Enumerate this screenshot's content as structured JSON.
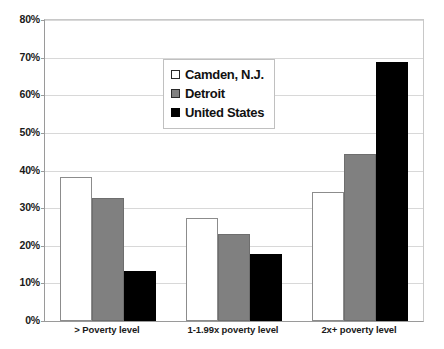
{
  "chart_data": {
    "type": "bar",
    "title": "",
    "subtitle": "",
    "xlabel": "",
    "ylabel": "",
    "categories": [
      "> Poverty level",
      "1-1.99x poverty level",
      "2x+ poverty level"
    ],
    "series": [
      {
        "name": "Camden, N.J.",
        "color": "#ffffff",
        "values": [
          38.3,
          27.5,
          34.2
        ]
      },
      {
        "name": "Detroit",
        "color": "#808080",
        "values": [
          32.7,
          23.2,
          44.3
        ]
      },
      {
        "name": "United States",
        "color": "#000000",
        "values": [
          13.3,
          17.9,
          68.8
        ]
      }
    ],
    "ylim": [
      0,
      80
    ],
    "ytick_step": 10,
    "ytick_labels": [
      "0%",
      "10%",
      "20%",
      "30%",
      "40%",
      "50%",
      "60%",
      "70%",
      "80%"
    ],
    "ytick_values": [
      0,
      10,
      20,
      30,
      40,
      50,
      60,
      70,
      80
    ],
    "grid": true,
    "grid_axis": "y",
    "legend_position": "upper-center",
    "value_format": "percent"
  },
  "legend": {
    "items": [
      {
        "label": "Camden, N.J.",
        "swatch": "white-square-marker"
      },
      {
        "label": "Detroit",
        "swatch": "gray-square-marker"
      },
      {
        "label": "United States",
        "swatch": "black-square-marker"
      }
    ]
  },
  "colors": {
    "camden": "#ffffff",
    "detroit": "#808080",
    "united_states": "#000000",
    "gridline": "#d8d8d8",
    "axis": "#9a9a9a",
    "text": "#1a1a1a",
    "background": "#ffffff"
  }
}
